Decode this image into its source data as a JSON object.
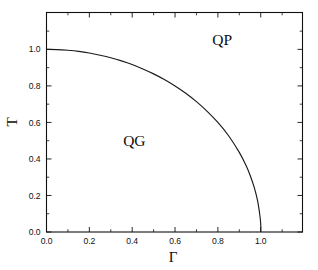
{
  "figure": {
    "background_color": "#ffffff",
    "line_color": "#111111",
    "axis_title_x": "Γ",
    "axis_title_y": "T"
  },
  "chart_data": {
    "type": "line",
    "title": "",
    "xlabel": "Γ",
    "ylabel": "T",
    "xlim": [
      0.0,
      1.195
    ],
    "ylim": [
      0.0,
      1.202
    ],
    "grid": false,
    "legend": null,
    "x_ticks_major": [
      0.0,
      0.2,
      0.4,
      0.6,
      0.8,
      1.0
    ],
    "x_tick_labels": [
      "0.0",
      "0.2",
      "0.4",
      "0.6",
      "0.8",
      "1.0"
    ],
    "x_ticks_minor": [
      0.1,
      0.3,
      0.5,
      0.7,
      0.9,
      1.1
    ],
    "y_ticks_major": [
      0.0,
      0.2,
      0.4,
      0.6,
      0.8,
      1.0
    ],
    "y_tick_labels": [
      "0.0",
      "0.2",
      "0.4",
      "0.6",
      "0.8",
      "1.0"
    ],
    "y_ticks_minor": [
      0.1,
      0.3,
      0.5,
      0.7,
      0.9,
      1.1
    ],
    "tick_direction": "in",
    "series": [
      {
        "name": "phase-boundary",
        "x": [
          0.0,
          0.05,
          0.1,
          0.15,
          0.2,
          0.25,
          0.3,
          0.35,
          0.4,
          0.45,
          0.5,
          0.55,
          0.6,
          0.65,
          0.7,
          0.75,
          0.8,
          0.85,
          0.9,
          0.93,
          0.95,
          0.97,
          0.985,
          0.995,
          1.0,
          1.0
        ],
        "y": [
          1.0,
          0.999,
          0.995,
          0.989,
          0.98,
          0.968,
          0.954,
          0.937,
          0.917,
          0.893,
          0.866,
          0.835,
          0.8,
          0.76,
          0.714,
          0.661,
          0.6,
          0.527,
          0.436,
          0.368,
          0.312,
          0.243,
          0.173,
          0.1,
          0.045,
          0.0
        ]
      }
    ],
    "annotations": [
      {
        "text": "QP",
        "x": 0.82,
        "y": 1.022,
        "region": "quark-plasma"
      },
      {
        "text": "QG",
        "x": 0.41,
        "y": 0.47,
        "region": "quark-gas"
      }
    ]
  }
}
